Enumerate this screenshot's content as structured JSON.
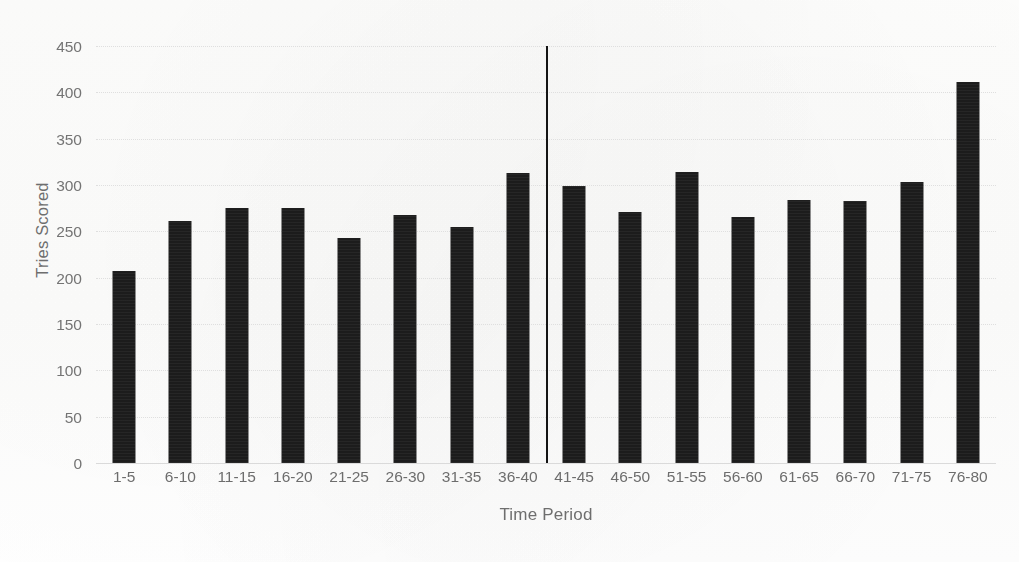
{
  "chart_data": {
    "type": "bar",
    "title": "",
    "xlabel": "Time Period",
    "ylabel": "Tries Scored",
    "categories": [
      "1-5",
      "6-10",
      "11-15",
      "16-20",
      "21-25",
      "26-30",
      "31-35",
      "36-40",
      "41-45",
      "46-50",
      "51-55",
      "56-60",
      "61-65",
      "66-70",
      "71-75",
      "76-80"
    ],
    "values": [
      207,
      261,
      275,
      275,
      243,
      268,
      255,
      313,
      299,
      271,
      314,
      265,
      284,
      283,
      303,
      411
    ],
    "ylim": [
      0,
      450
    ],
    "ytick_values": [
      0,
      50,
      100,
      150,
      200,
      250,
      300,
      350,
      400,
      450
    ],
    "ytick_labels": [
      "0",
      "50",
      "100",
      "150",
      "200",
      "250",
      "300",
      "350",
      "400",
      "450"
    ],
    "grid": true,
    "grid_style": "dotted-horizontal",
    "legend": null,
    "bar_color": "#1c1c1c",
    "grid_color": "#dedede",
    "text_color": "#6d6d6d",
    "background_color": "#fdfdfc",
    "annotations": [
      {
        "name": "half-time-divider",
        "type": "vertical-line",
        "between_categories": [
          "36-40",
          "41-45"
        ],
        "color": "#141414",
        "y_from": 0,
        "y_to": 450
      }
    ]
  },
  "axes": {
    "y_title": "Tries Scored",
    "x_title": "Time Period"
  }
}
